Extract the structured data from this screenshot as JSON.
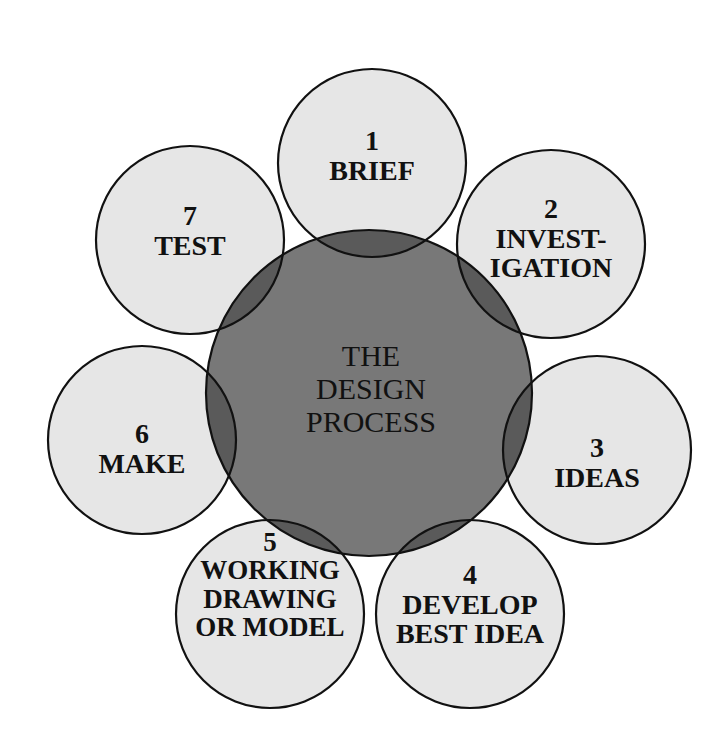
{
  "diagram": {
    "center": {
      "lines": [
        "THE",
        "DESIGN",
        "PROCESS"
      ],
      "cx": 369,
      "cy": 393,
      "r": 163
    },
    "steps": [
      {
        "number": "1",
        "lines": [
          "BRIEF"
        ],
        "cx": 372,
        "cy": 163
      },
      {
        "number": "2",
        "lines": [
          "INVEST-",
          "IGATION"
        ],
        "cx": 551,
        "cy": 244
      },
      {
        "number": "3",
        "lines": [
          "IDEAS"
        ],
        "cx": 597,
        "cy": 450
      },
      {
        "number": "4",
        "lines": [
          "DEVELOP",
          "BEST IDEA"
        ],
        "cx": 470,
        "cy": 614
      },
      {
        "number": "5",
        "lines": [
          "WORKING",
          "DRAWING",
          "OR MODEL"
        ],
        "cx": 270,
        "cy": 614
      },
      {
        "number": "6",
        "lines": [
          "MAKE"
        ],
        "cx": 142,
        "cy": 440
      },
      {
        "number": "7",
        "lines": [
          "TEST"
        ],
        "cx": 190,
        "cy": 240
      }
    ],
    "step_radius": 94,
    "colors": {
      "step_fill": "#e6e6e6",
      "center_fill": "#787878",
      "overlap_fill": "#5a5a5a",
      "stroke": "#111111",
      "text": "#111111"
    }
  }
}
